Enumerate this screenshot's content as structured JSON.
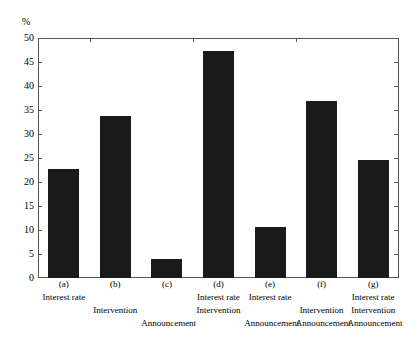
{
  "chart_data": {
    "type": "bar",
    "title": "",
    "subtitle": "",
    "xlabel": "",
    "ylabel": "%",
    "unit_label": "%",
    "ylim": [
      0,
      50
    ],
    "yticks": [
      0,
      5,
      10,
      15,
      20,
      25,
      30,
      35,
      40,
      45,
      50
    ],
    "ytick_labels": [
      "0",
      "5",
      "10",
      "15",
      "20",
      "25",
      "30",
      "35",
      "40",
      "45",
      "50"
    ],
    "grid": false,
    "legend": "none",
    "bar_color": "#1a1a1a",
    "categories": [
      "(a)",
      "(b)",
      "(c)",
      "(d)",
      "(e)",
      "(f)",
      "(g)"
    ],
    "values": [
      22.7,
      33.8,
      4.0,
      47.2,
      10.6,
      36.8,
      24.6
    ],
    "category_descriptions": [
      [
        "Interest rate"
      ],
      [
        "Intervention"
      ],
      [
        "Announcement"
      ],
      [
        "Interest rate",
        "Intervention"
      ],
      [
        "Interest rate",
        "Announcement"
      ],
      [
        "Intervention",
        "Announcement"
      ],
      [
        "Interest rate",
        "Intervention",
        "Announcement"
      ]
    ],
    "bars": [
      {
        "key": "(a)",
        "value": 22.7,
        "row1": "Interest rate",
        "row2": "",
        "row3": ""
      },
      {
        "key": "(b)",
        "value": 33.8,
        "row1": "",
        "row2": "Intervention",
        "row3": ""
      },
      {
        "key": "(c)",
        "value": 4.0,
        "row1": "",
        "row2": "",
        "row3": "Announcement"
      },
      {
        "key": "(d)",
        "value": 47.2,
        "row1": "Interest rate",
        "row2": "Intervention",
        "row3": ""
      },
      {
        "key": "(e)",
        "value": 10.6,
        "row1": "Interest rate",
        "row2": "",
        "row3": "Announcement"
      },
      {
        "key": "(f)",
        "value": 36.8,
        "row1": "",
        "row2": "Intervention",
        "row3": "Announcement"
      },
      {
        "key": "(g)",
        "value": 24.6,
        "row1": "Interest rate",
        "row2": "Intervention",
        "row3": "Announcement"
      }
    ]
  }
}
